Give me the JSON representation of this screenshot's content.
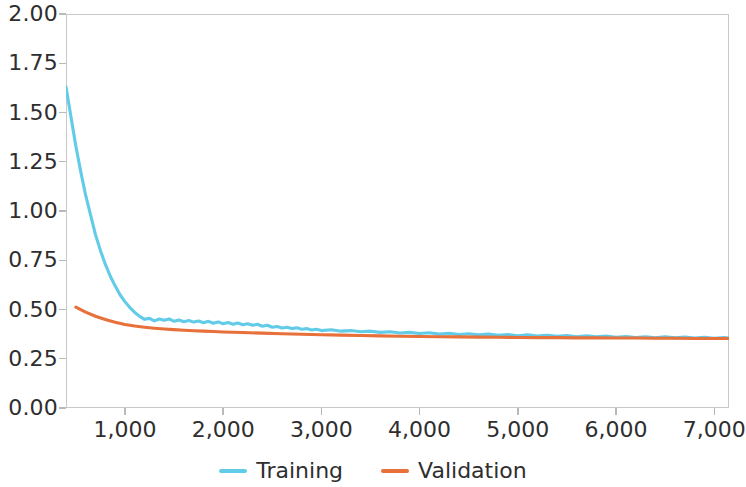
{
  "chart_data": {
    "type": "line",
    "title": "",
    "subtitle": "",
    "xlabel": "",
    "ylabel": "",
    "xlim": [
      400,
      7150
    ],
    "ylim": [
      0.0,
      2.0
    ],
    "grid": false,
    "legend_position": "bottom",
    "y_ticks": [
      "0.00",
      "0.25",
      "0.50",
      "0.75",
      "1.00",
      "1.25",
      "1.50",
      "1.75",
      "2.00"
    ],
    "y_tick_values": [
      0.0,
      0.25,
      0.5,
      0.75,
      1.0,
      1.25,
      1.5,
      1.75,
      2.0
    ],
    "x_ticks": [
      "1,000",
      "2,000",
      "3,000",
      "4,000",
      "5,000",
      "6,000",
      "7,000"
    ],
    "x_tick_values": [
      1000,
      2000,
      3000,
      4000,
      5000,
      6000,
      7000
    ],
    "series": [
      {
        "name": "Training",
        "color": "#62cbe8",
        "x": [
          400,
          450,
          500,
          550,
          600,
          650,
          700,
          750,
          800,
          850,
          900,
          950,
          1000,
          1050,
          1100,
          1150,
          1200,
          1250,
          1300,
          1350,
          1400,
          1450,
          1500,
          1550,
          1600,
          1650,
          1700,
          1750,
          1800,
          1850,
          1900,
          1950,
          2000,
          2050,
          2100,
          2150,
          2200,
          2250,
          2300,
          2350,
          2400,
          2450,
          2500,
          2550,
          2600,
          2650,
          2700,
          2750,
          2800,
          2850,
          2900,
          2950,
          3000,
          3100,
          3200,
          3300,
          3400,
          3500,
          3600,
          3700,
          3800,
          3900,
          4000,
          4100,
          4200,
          4300,
          4400,
          4500,
          4600,
          4700,
          4800,
          4900,
          5000,
          5100,
          5200,
          5300,
          5400,
          5500,
          5600,
          5700,
          5800,
          5900,
          6000,
          6100,
          6200,
          6300,
          6400,
          6500,
          6600,
          6700,
          6800,
          6900,
          7000,
          7100,
          7150
        ],
        "y": [
          1.63,
          1.48,
          1.33,
          1.2,
          1.08,
          0.98,
          0.88,
          0.8,
          0.73,
          0.67,
          0.62,
          0.575,
          0.54,
          0.51,
          0.485,
          0.465,
          0.45,
          0.455,
          0.442,
          0.452,
          0.445,
          0.452,
          0.44,
          0.447,
          0.438,
          0.444,
          0.436,
          0.442,
          0.433,
          0.44,
          0.43,
          0.437,
          0.428,
          0.434,
          0.425,
          0.431,
          0.423,
          0.428,
          0.42,
          0.425,
          0.415,
          0.42,
          0.41,
          0.414,
          0.406,
          0.41,
          0.403,
          0.407,
          0.4,
          0.403,
          0.396,
          0.4,
          0.393,
          0.397,
          0.39,
          0.393,
          0.387,
          0.39,
          0.384,
          0.387,
          0.381,
          0.384,
          0.378,
          0.382,
          0.375,
          0.379,
          0.373,
          0.377,
          0.371,
          0.375,
          0.369,
          0.373,
          0.367,
          0.371,
          0.365,
          0.369,
          0.364,
          0.368,
          0.362,
          0.366,
          0.361,
          0.365,
          0.359,
          0.363,
          0.358,
          0.362,
          0.357,
          0.361,
          0.356,
          0.36,
          0.355,
          0.359,
          0.354,
          0.358,
          0.355
        ]
      },
      {
        "name": "Validation",
        "color": "#e8703a",
        "x": [
          500,
          600,
          700,
          800,
          900,
          1000,
          1100,
          1200,
          1300,
          1400,
          1500,
          1600,
          1700,
          1800,
          1900,
          2000,
          2200,
          2400,
          2600,
          2800,
          3000,
          3200,
          3400,
          3600,
          3800,
          4000,
          4200,
          4400,
          4600,
          4800,
          5000,
          5200,
          5400,
          5600,
          5800,
          6000,
          6200,
          6400,
          6600,
          6800,
          7000,
          7150
        ],
        "y": [
          0.512,
          0.487,
          0.466,
          0.449,
          0.435,
          0.424,
          0.416,
          0.41,
          0.405,
          0.401,
          0.398,
          0.395,
          0.392,
          0.39,
          0.388,
          0.386,
          0.383,
          0.38,
          0.377,
          0.374,
          0.372,
          0.37,
          0.368,
          0.366,
          0.364,
          0.363,
          0.362,
          0.361,
          0.36,
          0.359,
          0.358,
          0.357,
          0.357,
          0.356,
          0.356,
          0.355,
          0.355,
          0.354,
          0.354,
          0.353,
          0.353,
          0.353
        ]
      }
    ]
  },
  "legend": {
    "items": [
      {
        "label": "Training",
        "color": "#62cbe8",
        "icon": "line-swatch"
      },
      {
        "label": "Validation",
        "color": "#e8703a",
        "icon": "line-swatch"
      }
    ]
  },
  "axes": {
    "frame_color": "#c9c9c9",
    "tick_color": "#b9b9b9",
    "label_color": "#2e2e2e"
  }
}
